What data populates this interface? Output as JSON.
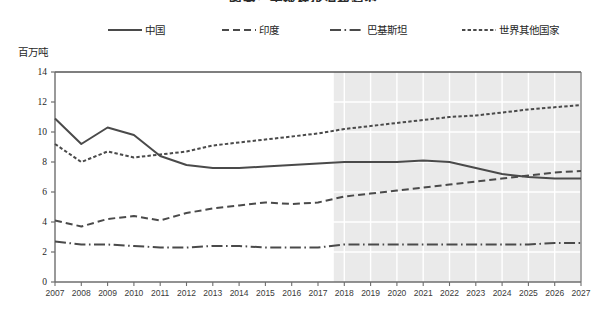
{
  "title": "图表：全球棉花消费趋势",
  "y_unit": "百万吨",
  "legend": {
    "position": "top",
    "items": [
      {
        "id": "cn",
        "label": "中国",
        "style": "solid",
        "icon": "solid-line-icon"
      },
      {
        "id": "in",
        "label": "印度",
        "style": "dashed",
        "icon": "dashed-line-icon"
      },
      {
        "id": "pk",
        "label": "巴基斯坦",
        "style": "dashdot",
        "icon": "dash-dot-line-icon"
      },
      {
        "id": "row",
        "label": "世界其他国家",
        "style": "dotted",
        "icon": "dotted-line-icon"
      }
    ]
  },
  "forecast": {
    "label": "预测区间",
    "start_year": 2017.6,
    "shading_color": "#eaeaea"
  },
  "colors": {
    "line": "#4a4a4a",
    "axis": "#6e6e6e",
    "gridline": "#ffffff",
    "plot_background": "#ffffff",
    "forecast_background": "#eaeaea"
  },
  "chart_data": {
    "type": "line",
    "title": "图表：全球棉花消费趋势",
    "xlabel": "",
    "ylabel": "百万吨",
    "ylim": [
      0,
      14
    ],
    "yticks": [
      0,
      2,
      4,
      6,
      8,
      10,
      12,
      14
    ],
    "ytick_labels": [
      "0",
      "2",
      "4",
      "6",
      "8",
      "10",
      "12",
      "14"
    ],
    "grid": true,
    "legend_position": "top",
    "x": [
      2007,
      2008,
      2009,
      2010,
      2011,
      2012,
      2013,
      2014,
      2015,
      2016,
      2017,
      2018,
      2019,
      2020,
      2021,
      2022,
      2023,
      2024,
      2025,
      2026,
      2027
    ],
    "xtick_labels": [
      "2007",
      "2008",
      "2009",
      "2010",
      "2011",
      "2012",
      "2013",
      "2014",
      "2015",
      "2016",
      "2017",
      "2018",
      "2019",
      "2020",
      "2021",
      "2022",
      "2023",
      "2024",
      "2025",
      "2026",
      "2027"
    ],
    "series": [
      {
        "name": "中国",
        "style": "solid",
        "values": [
          10.9,
          9.2,
          10.3,
          9.8,
          8.4,
          7.8,
          7.6,
          7.6,
          7.7,
          7.8,
          7.9,
          8.0,
          8.0,
          8.0,
          8.1,
          8.0,
          7.6,
          7.2,
          7.0,
          6.9,
          6.9
        ]
      },
      {
        "name": "印度",
        "style": "dashed",
        "values": [
          4.1,
          3.7,
          4.2,
          4.4,
          4.1,
          4.6,
          4.9,
          5.1,
          5.3,
          5.2,
          5.3,
          5.7,
          5.9,
          6.1,
          6.3,
          6.5,
          6.7,
          6.9,
          7.1,
          7.3,
          7.4
        ]
      },
      {
        "name": "巴基斯坦",
        "style": "dashdot",
        "values": [
          2.7,
          2.5,
          2.5,
          2.4,
          2.3,
          2.3,
          2.4,
          2.4,
          2.3,
          2.3,
          2.3,
          2.5,
          2.5,
          2.5,
          2.5,
          2.5,
          2.5,
          2.5,
          2.5,
          2.6,
          2.6
        ]
      },
      {
        "name": "世界其他国家",
        "style": "dotted",
        "values": [
          9.2,
          8.0,
          8.7,
          8.3,
          8.5,
          8.7,
          9.1,
          9.3,
          9.5,
          9.7,
          9.9,
          10.2,
          10.4,
          10.6,
          10.8,
          11.0,
          11.1,
          11.3,
          11.5,
          11.65,
          11.8
        ]
      }
    ]
  }
}
